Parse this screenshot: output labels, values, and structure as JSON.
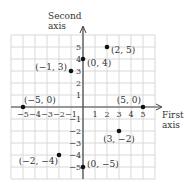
{
  "chart_data": {
    "type": "scatter",
    "title": "",
    "xlabel": "First axis",
    "ylabel": "Second axis",
    "xlabel_lines": [
      "First",
      "axis"
    ],
    "ylabel_lines": [
      "Second",
      "axis"
    ],
    "xlim": [
      -6,
      6
    ],
    "ylim": [
      -6,
      6
    ],
    "grid": true,
    "x_ticks": [
      -5,
      -4,
      -3,
      -2,
      -1,
      1,
      2,
      3,
      4,
      5
    ],
    "y_ticks": [
      5,
      4,
      3,
      2,
      1,
      -1,
      -2,
      -3,
      -4,
      -5
    ],
    "x_tick_labels": [
      "−5",
      "−4",
      "−3",
      "−2",
      "−1",
      "1",
      "2",
      "3",
      "4",
      "5"
    ],
    "y_tick_labels": [
      "5",
      "4",
      "3",
      "2",
      "1",
      "−1",
      "−2",
      "−3",
      "−4",
      "−5"
    ],
    "points": [
      {
        "x": 2,
        "y": 5,
        "label": "(2, 5)"
      },
      {
        "x": 0,
        "y": 4,
        "label": "(0, 4)"
      },
      {
        "x": -1,
        "y": 3,
        "label": "(−1, 3)"
      },
      {
        "x": -5,
        "y": 0,
        "label": "(−5, 0)"
      },
      {
        "x": 5,
        "y": 0,
        "label": "(5, 0)"
      },
      {
        "x": 3,
        "y": -2,
        "label": "(3, −2)"
      },
      {
        "x": -2,
        "y": -4,
        "label": "(−2, −4)"
      },
      {
        "x": 0,
        "y": -5,
        "label": "(0, −5)"
      }
    ]
  },
  "colors": {
    "grid": "#d8d8d8",
    "axis": "#444444",
    "point": "#111111",
    "text": "#333333"
  }
}
